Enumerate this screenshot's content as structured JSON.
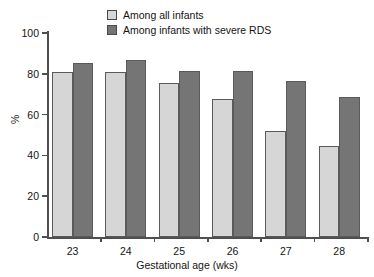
{
  "chart_data": {
    "type": "bar",
    "title": "",
    "subtitle": "",
    "xlabel": "Gestational age (wks)",
    "ylabel": "%",
    "categories": [
      "23",
      "24",
      "25",
      "26",
      "27",
      "28"
    ],
    "ylim": [
      0,
      100
    ],
    "yticks": [
      0,
      20,
      40,
      60,
      80,
      100
    ],
    "ytick_labels": [
      "0",
      "20",
      "40",
      "60",
      "80",
      "100"
    ],
    "grid": false,
    "legend_position": "top-center",
    "series": [
      {
        "name": "Among all infants",
        "color": "#d6d6d6",
        "edge_color": "#5a5a5a",
        "values": [
          81,
          81,
          75.5,
          67.5,
          52,
          44.5
        ]
      },
      {
        "name": "Among infants with severe RDS",
        "color": "#757575",
        "edge_color": "#5a5a5a",
        "values": [
          85.5,
          87,
          81.5,
          81.5,
          76.5,
          68.5
        ]
      }
    ],
    "annotations": []
  },
  "axis": {
    "line_color": "#4f4f4f"
  }
}
